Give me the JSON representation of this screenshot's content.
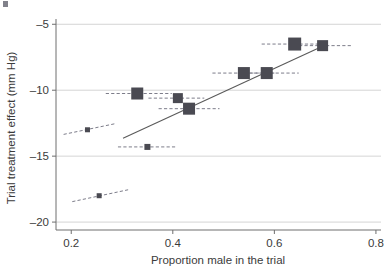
{
  "chart_data": {
    "type": "scatter",
    "title": "",
    "xlabel": "Proportion male in the trial",
    "ylabel": "Trial treatment effect (mm Hg)",
    "xlim": [
      0.17,
      0.81
    ],
    "ylim": [
      -20.6,
      -4.6
    ],
    "xticks": [
      0.2,
      0.4,
      0.6,
      0.8
    ],
    "xtick_labels": [
      "0.2",
      "0.4",
      "0.6",
      "0.8"
    ],
    "yticks": [
      -5,
      -10,
      -15,
      -20
    ],
    "ytick_labels": [
      "–5",
      "–10",
      "–15",
      "–20"
    ],
    "grid": "horizontal",
    "legend": "none",
    "marker_shape": "square",
    "marker_color": "#4a4a52",
    "points": [
      {
        "x": 0.232,
        "y": -13.0,
        "size": 5,
        "ci_x0": 0.185,
        "ci_y0": -13.35,
        "ci_x1": 0.285,
        "ci_y1": -12.55
      },
      {
        "x": 0.255,
        "y": -18.0,
        "size": 5,
        "ci_x0": 0.202,
        "ci_y0": -18.45,
        "ci_x1": 0.312,
        "ci_y1": -17.55
      },
      {
        "x": 0.33,
        "y": -10.25,
        "size": 12,
        "ci_x0": 0.268,
        "ci_y0": -10.25,
        "ci_x1": 0.398,
        "ci_y1": -10.25
      },
      {
        "x": 0.35,
        "y": -14.3,
        "size": 6,
        "ci_x0": 0.292,
        "ci_y0": -14.3,
        "ci_x1": 0.405,
        "ci_y1": -14.3
      },
      {
        "x": 0.41,
        "y": -10.6,
        "size": 10,
        "ci_x0": 0.352,
        "ci_y0": -10.6,
        "ci_x1": 0.462,
        "ci_y1": -10.6
      },
      {
        "x": 0.432,
        "y": -11.4,
        "size": 12,
        "ci_x0": 0.372,
        "ci_y0": -11.4,
        "ci_x1": 0.492,
        "ci_y1": -11.4
      },
      {
        "x": 0.54,
        "y": -8.7,
        "size": 12,
        "ci_x0": 0.478,
        "ci_y0": -8.7,
        "ci_x1": 0.6,
        "ci_y1": -8.7
      },
      {
        "x": 0.585,
        "y": -8.7,
        "size": 12,
        "ci_x0": 0.528,
        "ci_y0": -8.7,
        "ci_x1": 0.648,
        "ci_y1": -8.7
      },
      {
        "x": 0.64,
        "y": -6.5,
        "size": 13,
        "ci_x0": 0.575,
        "ci_y0": -6.5,
        "ci_x1": 0.7,
        "ci_y1": -6.5
      },
      {
        "x": 0.695,
        "y": -6.62,
        "size": 11,
        "ci_x0": 0.638,
        "ci_y0": -6.62,
        "ci_x1": 0.752,
        "ci_y1": -6.62
      }
    ],
    "fit_line": {
      "name": "meta-regression line",
      "x0": 0.302,
      "y0": -13.65,
      "x1": 0.697,
      "y1": -6.62
    }
  }
}
